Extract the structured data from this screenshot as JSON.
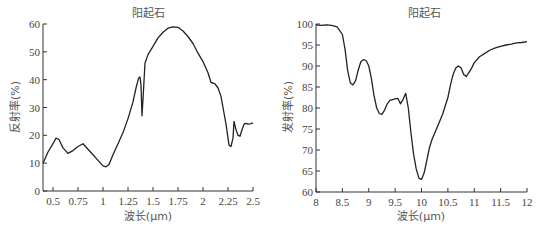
{
  "chart_data": [
    {
      "type": "line",
      "title": "阳起石",
      "xlabel": "波长(μm)",
      "ylabel": "反射率(%)",
      "xlim": [
        0.4,
        2.5
      ],
      "ylim": [
        0,
        60
      ],
      "xticks": [
        0.5,
        0.75,
        1,
        1.25,
        1.5,
        1.75,
        2,
        2.25,
        2.5
      ],
      "xtick_labels": [
        "0.5",
        "0.75",
        "1",
        "1.25",
        "1.5",
        "1.75",
        "2",
        "2.25",
        "2.5"
      ],
      "yticks": [
        0,
        10,
        20,
        30,
        40,
        50,
        60
      ],
      "ytick_labels": [
        "0",
        "10",
        "20",
        "30",
        "40",
        "50",
        "60"
      ],
      "grid": false,
      "series": [
        {
          "name": "阳起石 反射光谱",
          "x": [
            0.4,
            0.45,
            0.5,
            0.53,
            0.56,
            0.6,
            0.65,
            0.7,
            0.75,
            0.8,
            0.85,
            0.9,
            0.95,
            1.0,
            1.03,
            1.06,
            1.1,
            1.15,
            1.2,
            1.25,
            1.3,
            1.33,
            1.355,
            1.37,
            1.38,
            1.39,
            1.4,
            1.42,
            1.45,
            1.5,
            1.55,
            1.6,
            1.65,
            1.7,
            1.75,
            1.8,
            1.85,
            1.9,
            1.95,
            2.0,
            2.05,
            2.08,
            2.1,
            2.12,
            2.15,
            2.18,
            2.2,
            2.23,
            2.26,
            2.28,
            2.3,
            2.31,
            2.33,
            2.35,
            2.37,
            2.39,
            2.41,
            2.43,
            2.45,
            2.48,
            2.5
          ],
          "y": [
            10,
            14,
            17,
            19,
            18.5,
            15.5,
            13.5,
            14.5,
            16,
            17,
            15,
            13,
            11,
            9,
            8.7,
            9.5,
            13,
            17,
            21,
            26,
            32,
            37,
            40.5,
            41,
            38,
            27,
            33,
            46,
            49,
            52,
            55,
            57,
            58.5,
            59,
            58.8,
            57.5,
            55.5,
            53,
            49.5,
            46.5,
            42.5,
            39,
            38.8,
            38.5,
            37,
            34,
            30,
            24,
            16.5,
            16,
            19,
            25,
            22,
            20,
            19.7,
            22,
            24,
            24.3,
            24,
            24.2,
            24.5
          ]
        }
      ]
    },
    {
      "type": "line",
      "title": "阳起石",
      "xlabel": "波长(μm)",
      "ylabel": "发射率(%)",
      "xlim": [
        8,
        12
      ],
      "ylim": [
        60,
        100
      ],
      "xticks": [
        8,
        8.5,
        9,
        9.5,
        10,
        10.5,
        11,
        11.5,
        12
      ],
      "xtick_labels": [
        "8",
        "8.5",
        "9",
        "9.5",
        "10",
        "10.5",
        "11",
        "11.5",
        "12"
      ],
      "yticks": [
        60,
        65,
        70,
        75,
        80,
        85,
        90,
        95,
        100
      ],
      "ytick_labels": [
        "60",
        "65",
        "70",
        "75",
        "80",
        "85",
        "90",
        "95",
        "100"
      ],
      "grid": false,
      "series": [
        {
          "name": "阳起石 发射光谱",
          "x": [
            8.0,
            8.1,
            8.2,
            8.3,
            8.4,
            8.5,
            8.55,
            8.6,
            8.65,
            8.7,
            8.75,
            8.8,
            8.85,
            8.9,
            8.95,
            9.0,
            9.05,
            9.1,
            9.15,
            9.2,
            9.25,
            9.3,
            9.35,
            9.4,
            9.45,
            9.5,
            9.55,
            9.6,
            9.65,
            9.7,
            9.75,
            9.8,
            9.85,
            9.9,
            9.95,
            10.0,
            10.05,
            10.1,
            10.15,
            10.2,
            10.3,
            10.4,
            10.5,
            10.55,
            10.6,
            10.65,
            10.7,
            10.75,
            10.8,
            10.85,
            10.9,
            10.95,
            11.0,
            11.1,
            11.2,
            11.3,
            11.4,
            11.5,
            11.6,
            11.7,
            11.8,
            11.9,
            12.0
          ],
          "y": [
            99.8,
            99.7,
            99.8,
            99.7,
            99.3,
            97.5,
            94,
            89,
            86,
            85.5,
            86.5,
            89,
            91,
            91.5,
            91.3,
            90,
            87,
            83,
            80,
            78.7,
            78.5,
            79.5,
            81,
            81.8,
            82,
            82.2,
            82.3,
            81,
            82,
            83.5,
            80,
            74,
            69,
            65.5,
            63.3,
            63,
            64.5,
            67.5,
            70.5,
            72.5,
            75.5,
            78.5,
            82.5,
            85.5,
            88,
            89.5,
            90,
            89.5,
            88,
            87.5,
            88.5,
            89.5,
            90.8,
            92.2,
            93,
            93.8,
            94.3,
            94.7,
            95,
            95.2,
            95.5,
            95.6,
            95.8
          ]
        }
      ]
    }
  ],
  "charts": [
    {
      "title": "阳起石",
      "xlabel": "波长(μm)",
      "ylabel": "反射率(%)"
    },
    {
      "title": "阳起石",
      "xlabel": "波长(μm)",
      "ylabel": "发射率(%)"
    }
  ]
}
